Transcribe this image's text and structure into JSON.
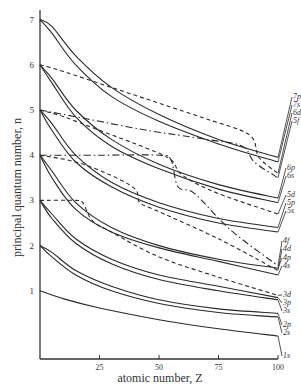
{
  "chart_data": {
    "type": "line",
    "title": "",
    "xlabel": "atomic number, Z",
    "ylabel": "principal quantum number, n",
    "xlim": [
      0,
      100
    ],
    "ylim": [
      0,
      7
    ],
    "x_ticks": [
      25,
      50,
      75,
      100
    ],
    "y_ticks": [
      1,
      2,
      3,
      4,
      5,
      6,
      7
    ],
    "grid": false,
    "legend": "inline labels at right end of curves",
    "series": [
      {
        "name": "7p",
        "style": "solid",
        "x": [
          0,
          5,
          15,
          30,
          50,
          75,
          100
        ],
        "y": [
          7.0,
          6.85,
          6.2,
          5.5,
          4.9,
          4.35,
          3.95
        ]
      },
      {
        "name": "7s",
        "style": "solid",
        "x": [
          0,
          5,
          15,
          30,
          50,
          75,
          100
        ],
        "y": [
          7.0,
          6.7,
          6.0,
          5.3,
          4.75,
          4.25,
          3.85
        ]
      },
      {
        "name": "6d",
        "style": "dashed",
        "x": [
          0,
          10,
          30,
          50,
          70,
          88,
          92,
          100
        ],
        "y": [
          6.0,
          5.85,
          5.5,
          5.15,
          4.8,
          4.45,
          3.95,
          3.6
        ]
      },
      {
        "name": "5f",
        "style": "dash-dot",
        "x": [
          0,
          20,
          45,
          70,
          85,
          90,
          100
        ],
        "y": [
          5.0,
          4.8,
          4.55,
          4.35,
          4.2,
          3.85,
          3.5
        ]
      },
      {
        "name": "6p",
        "style": "solid",
        "x": [
          0,
          5,
          15,
          30,
          50,
          75,
          100
        ],
        "y": [
          6.0,
          5.7,
          5.0,
          4.35,
          3.8,
          3.35,
          3.05
        ]
      },
      {
        "name": "6s",
        "style": "solid",
        "x": [
          0,
          5,
          15,
          30,
          50,
          75,
          100
        ],
        "y": [
          6.0,
          5.6,
          4.85,
          4.2,
          3.7,
          3.25,
          2.95
        ]
      },
      {
        "name": "5d",
        "style": "dashed",
        "x": [
          0,
          10,
          25,
          45,
          55,
          60,
          75,
          100
        ],
        "y": [
          5.0,
          4.85,
          4.55,
          4.15,
          3.9,
          3.55,
          3.15,
          2.7
        ]
      },
      {
        "name": "5p",
        "style": "solid",
        "x": [
          0,
          5,
          15,
          30,
          50,
          75,
          100
        ],
        "y": [
          5.0,
          4.7,
          4.0,
          3.4,
          2.95,
          2.6,
          2.4
        ]
      },
      {
        "name": "5s",
        "style": "solid",
        "x": [
          0,
          5,
          15,
          30,
          50,
          75,
          100
        ],
        "y": [
          5.0,
          4.55,
          3.85,
          3.3,
          2.85,
          2.5,
          2.3
        ]
      },
      {
        "name": "4f",
        "style": "dash-dot",
        "x": [
          0,
          25,
          50,
          55,
          58,
          65,
          80,
          100
        ],
        "y": [
          4.0,
          4.0,
          4.0,
          3.9,
          3.3,
          3.15,
          2.35,
          1.55
        ]
      },
      {
        "name": "4d",
        "style": "dashed",
        "x": [
          0,
          15,
          30,
          40,
          42,
          50,
          75,
          100
        ],
        "y": [
          4.0,
          3.85,
          3.55,
          3.25,
          2.95,
          2.75,
          2.15,
          1.45
        ]
      },
      {
        "name": "4p",
        "style": "solid",
        "x": [
          0,
          5,
          15,
          30,
          50,
          75,
          100
        ],
        "y": [
          4.0,
          3.65,
          2.95,
          2.4,
          2.0,
          1.7,
          1.5
        ]
      },
      {
        "name": "4s",
        "style": "solid",
        "x": [
          0,
          5,
          15,
          30,
          50,
          75,
          100
        ],
        "y": [
          4.0,
          3.5,
          2.8,
          2.3,
          1.95,
          1.65,
          1.35
        ]
      },
      {
        "name": "3d",
        "style": "dashed",
        "x": [
          0,
          15,
          18,
          22,
          30,
          50,
          75,
          100
        ],
        "y": [
          3.0,
          3.0,
          2.95,
          2.55,
          2.3,
          1.75,
          1.3,
          0.9
        ]
      },
      {
        "name": "3p",
        "style": "solid",
        "x": [
          0,
          5,
          15,
          30,
          50,
          75,
          100
        ],
        "y": [
          3.0,
          2.7,
          2.15,
          1.7,
          1.35,
          1.1,
          0.85
        ]
      },
      {
        "name": "3s",
        "style": "solid",
        "x": [
          0,
          5,
          15,
          30,
          50,
          75,
          100
        ],
        "y": [
          3.0,
          2.6,
          2.05,
          1.6,
          1.25,
          1.0,
          0.8
        ]
      },
      {
        "name": "2p",
        "style": "solid",
        "x": [
          0,
          5,
          15,
          30,
          50,
          75,
          100
        ],
        "y": [
          2.0,
          1.85,
          1.45,
          1.1,
          0.8,
          0.6,
          0.5
        ]
      },
      {
        "name": "2s",
        "style": "solid",
        "x": [
          0,
          5,
          15,
          30,
          50,
          75,
          100
        ],
        "y": [
          2.0,
          1.75,
          1.35,
          1.0,
          0.72,
          0.52,
          0.42
        ]
      },
      {
        "name": "1s",
        "style": "solid",
        "x": [
          0,
          10,
          25,
          50,
          75,
          100
        ],
        "y": [
          1.0,
          0.82,
          0.62,
          0.36,
          0.16,
          0.0
        ]
      }
    ]
  },
  "labels": {
    "x_axis": "atomic number, Z",
    "y_axis": "principal quantum number, n"
  }
}
